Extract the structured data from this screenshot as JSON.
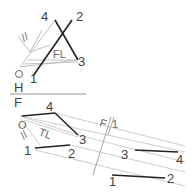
{
  "diagram": {
    "type": "descriptive-geometry-projection",
    "top_view": {
      "points": {
        "p1": "1",
        "p2": "2",
        "p3": "3",
        "p4": "4"
      },
      "origin_label": "O",
      "true_length_label": "FL",
      "parallel_mark": "//"
    },
    "fold_line_hf": {
      "upper": "H",
      "lower": "F"
    },
    "front_view": {
      "points": {
        "p1": "1",
        "p2": "2",
        "p3": "3",
        "p4": "4"
      },
      "origin_label": "O",
      "true_length_label": "TL",
      "parallel_mark": "//"
    },
    "fold_line_f1": {
      "left": "F",
      "right": "1"
    },
    "auxiliary_view": {
      "points": {
        "p1": "1",
        "p2": "2",
        "p3": "3",
        "p4": "4"
      }
    },
    "colors": {
      "heavy": "#222222",
      "light": "#aaaaaa",
      "text": "#444444"
    }
  }
}
